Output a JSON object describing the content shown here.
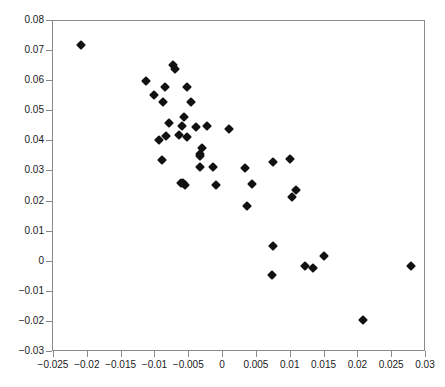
{
  "chart_data": {
    "type": "scatter",
    "title": "",
    "subtitle": "",
    "xlabel": "",
    "ylabel": "",
    "xlim": [
      -0.025,
      0.03
    ],
    "ylim": [
      -0.03,
      0.08
    ],
    "grid": false,
    "legend": false,
    "marker": {
      "shape": "diamond",
      "color": "#111111",
      "size_px": 7
    },
    "axis_color": "#8a8a8a",
    "background": "#ffffff",
    "xticks": [
      -0.025,
      -0.02,
      -0.015,
      -0.01,
      -0.005,
      0,
      0.005,
      0.01,
      0.015,
      0.02,
      0.025,
      0.03
    ],
    "xticklabels": [
      "−0.025",
      "−0.02",
      "−0.015",
      "−0.01",
      "−0.005",
      "0",
      "0.005",
      "0.01",
      "0.015",
      "0.02",
      "0.025",
      "0.03"
    ],
    "yticks": [
      -0.03,
      -0.02,
      -0.01,
      0,
      0.01,
      0.02,
      0.03,
      0.04,
      0.05,
      0.06,
      0.07,
      0.08
    ],
    "yticklabels": [
      "−0.03",
      "−0.02",
      "−0.01",
      "0",
      "0.01",
      "0.02",
      "0.03",
      "0.04",
      "0.05",
      "0.06",
      "0.07",
      "0.08"
    ],
    "n_points": 52,
    "points": [
      [
        -0.0208,
        0.0716
      ],
      [
        -0.0072,
        0.065
      ],
      [
        -0.007,
        0.0637
      ],
      [
        -0.0113,
        0.0598
      ],
      [
        -0.0085,
        0.0577
      ],
      [
        -0.0052,
        0.0577
      ],
      [
        -0.01,
        0.055
      ],
      [
        -0.0087,
        0.0529
      ],
      [
        -0.0046,
        0.0526
      ],
      [
        -0.0057,
        0.0478
      ],
      [
        -0.0079,
        0.0457
      ],
      [
        -0.0059,
        0.0449
      ],
      [
        -0.0038,
        0.0443
      ],
      [
        -0.0022,
        0.0447
      ],
      [
        0.001,
        0.0438
      ],
      [
        -0.0083,
        0.0414
      ],
      [
        -0.0064,
        0.0417
      ],
      [
        -0.0052,
        0.0411
      ],
      [
        -0.0094,
        0.04
      ],
      [
        -0.003,
        0.0374
      ],
      [
        -0.0033,
        0.0354
      ],
      [
        -0.0033,
        0.0347
      ],
      [
        -0.0089,
        0.0336
      ],
      [
        0.0101,
        0.0339
      ],
      [
        0.0075,
        0.0329
      ],
      [
        -0.0032,
        0.0311
      ],
      [
        -0.0014,
        0.0311
      ],
      [
        0.0034,
        0.0309
      ],
      [
        -0.0061,
        0.0259
      ],
      [
        -0.0058,
        0.0257
      ],
      [
        -0.0055,
        0.0251
      ],
      [
        -0.0009,
        0.0253
      ],
      [
        0.0044,
        0.0254
      ],
      [
        0.011,
        0.0234
      ],
      [
        0.0103,
        0.0213
      ],
      [
        0.0037,
        0.0182
      ],
      [
        0.0075,
        0.0048
      ],
      [
        0.015,
        0.0017
      ],
      [
        0.0122,
        -0.0017
      ],
      [
        0.0134,
        -0.0023
      ],
      [
        0.028,
        -0.0018
      ],
      [
        0.0074,
        -0.0048
      ],
      [
        0.0209,
        -0.0198
      ]
    ]
  }
}
